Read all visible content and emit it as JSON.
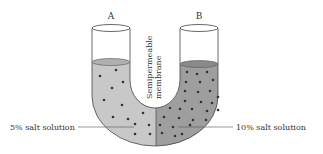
{
  "diagram": {
    "labels": {
      "arm_a": "A",
      "arm_b": "B",
      "membrane_line1": "Semipermeable",
      "membrane_line2": "membrane",
      "left_solution": "5% salt solution",
      "right_solution": "10% salt solution"
    },
    "colors": {
      "left_fill": "#c8c8c8",
      "right_fill": "#9e9e9e",
      "outline": "#444444",
      "particle": "#333333"
    },
    "left_particles": [
      [
        116,
        70
      ],
      [
        100,
        76
      ],
      [
        123,
        82
      ],
      [
        112,
        88
      ],
      [
        104,
        100
      ],
      [
        122,
        105
      ],
      [
        113,
        117
      ],
      [
        128,
        119
      ],
      [
        143,
        113
      ],
      [
        135,
        124
      ],
      [
        149,
        125
      ],
      [
        150,
        134
      ],
      [
        135,
        134
      ]
    ],
    "right_particles": [
      [
        187,
        72
      ],
      [
        197,
        74
      ],
      [
        207,
        72
      ],
      [
        186,
        82
      ],
      [
        200,
        82
      ],
      [
        213,
        80
      ],
      [
        185,
        91
      ],
      [
        198,
        92
      ],
      [
        210,
        91
      ],
      [
        218,
        97
      ],
      [
        185,
        101
      ],
      [
        201,
        102
      ],
      [
        212,
        103
      ],
      [
        170,
        108
      ],
      [
        180,
        109
      ],
      [
        192,
        109
      ],
      [
        207,
        111
      ],
      [
        218,
        110
      ],
      [
        164,
        117
      ],
      [
        179,
        118
      ],
      [
        193,
        120
      ],
      [
        206,
        120
      ],
      [
        160,
        125
      ],
      [
        173,
        127
      ],
      [
        190,
        125
      ],
      [
        162,
        133
      ],
      [
        175,
        136
      ],
      [
        182,
        134
      ]
    ]
  }
}
